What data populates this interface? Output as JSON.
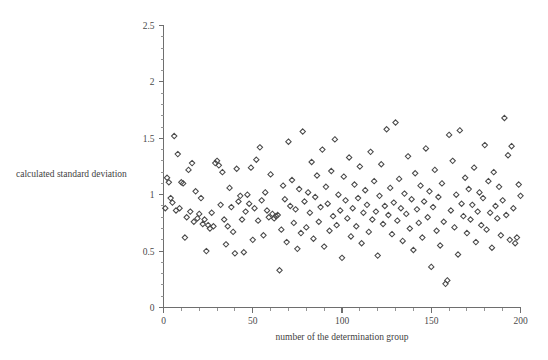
{
  "chart_data": {
    "type": "scatter",
    "title": "",
    "xlabel": "number of the determination group",
    "ylabel": "calculated standard deviation",
    "xlim": [
      0,
      200
    ],
    "ylim": [
      0,
      2.5
    ],
    "grid": false,
    "legend": null,
    "marker": "open-diamond",
    "marker_color": "#4a4a4a",
    "axis_color": "#6e6e6e",
    "background": "#ffffff",
    "x_major_ticks": [
      0,
      50,
      100,
      150,
      200
    ],
    "x_tick_labels": [
      "0",
      "50",
      "100",
      "150",
      "200"
    ],
    "x_minor_step": 10,
    "y_major_ticks": [
      0,
      0.5,
      1,
      1.5,
      2,
      2.5
    ],
    "y_tick_labels": [
      "0",
      "0.5",
      "1",
      "1.5",
      "2",
      "2.5"
    ],
    "y_minor_step": 0.1,
    "n_points": 200,
    "points": [
      [
        1,
        0.88
      ],
      [
        2,
        1.15
      ],
      [
        3,
        1.11
      ],
      [
        4,
        0.97
      ],
      [
        5,
        0.93
      ],
      [
        6,
        1.52
      ],
      [
        7,
        0.86
      ],
      [
        8,
        1.36
      ],
      [
        9,
        0.88
      ],
      [
        10,
        1.11
      ],
      [
        11,
        1.1
      ],
      [
        12,
        0.62
      ],
      [
        13,
        0.8
      ],
      [
        14,
        1.22
      ],
      [
        15,
        0.85
      ],
      [
        16,
        1.28
      ],
      [
        17,
        0.76
      ],
      [
        18,
        1.03
      ],
      [
        19,
        0.79
      ],
      [
        20,
        0.83
      ],
      [
        21,
        0.97
      ],
      [
        22,
        0.74
      ],
      [
        23,
        0.78
      ],
      [
        24,
        0.5
      ],
      [
        25,
        0.73
      ],
      [
        26,
        0.7
      ],
      [
        27,
        0.84
      ],
      [
        28,
        0.72
      ],
      [
        29,
        1.28
      ],
      [
        30,
        1.3
      ],
      [
        31,
        1.26
      ],
      [
        32,
        0.91
      ],
      [
        33,
        1.2
      ],
      [
        34,
        0.78
      ],
      [
        35,
        0.56
      ],
      [
        36,
        0.72
      ],
      [
        37,
        1.06
      ],
      [
        38,
        0.89
      ],
      [
        39,
        0.67
      ],
      [
        40,
        0.48
      ],
      [
        41,
        1.23
      ],
      [
        42,
        0.94
      ],
      [
        43,
        0.99
      ],
      [
        44,
        0.78
      ],
      [
        45,
        0.49
      ],
      [
        46,
        0.85
      ],
      [
        47,
        1.0
      ],
      [
        48,
        0.92
      ],
      [
        49,
        1.24
      ],
      [
        50,
        0.6
      ],
      [
        51,
        0.88
      ],
      [
        52,
        1.31
      ],
      [
        53,
        0.77
      ],
      [
        54,
        1.42
      ],
      [
        55,
        0.95
      ],
      [
        56,
        0.64
      ],
      [
        57,
        1.02
      ],
      [
        58,
        0.86
      ],
      [
        59,
        0.8
      ],
      [
        60,
        1.18
      ],
      [
        61,
        0.83
      ],
      [
        62,
        0.79
      ],
      [
        63,
        0.81
      ],
      [
        64,
        0.82
      ],
      [
        65,
        0.33
      ],
      [
        66,
        0.69
      ],
      [
        67,
        1.08
      ],
      [
        68,
        0.96
      ],
      [
        69,
        0.58
      ],
      [
        70,
        1.47
      ],
      [
        71,
        0.9
      ],
      [
        72,
        1.13
      ],
      [
        73,
        0.75
      ],
      [
        74,
        0.87
      ],
      [
        75,
        0.52
      ],
      [
        76,
        1.05
      ],
      [
        77,
        0.66
      ],
      [
        78,
        1.56
      ],
      [
        79,
        0.94
      ],
      [
        80,
        0.71
      ],
      [
        81,
        1.02
      ],
      [
        82,
        0.84
      ],
      [
        83,
        1.29
      ],
      [
        84,
        0.61
      ],
      [
        85,
        0.98
      ],
      [
        86,
        1.17
      ],
      [
        87,
        0.76
      ],
      [
        88,
        0.89
      ],
      [
        89,
        1.4
      ],
      [
        90,
        0.54
      ],
      [
        91,
        1.07
      ],
      [
        92,
        0.92
      ],
      [
        93,
        0.68
      ],
      [
        94,
        1.21
      ],
      [
        95,
        0.81
      ],
      [
        96,
        1.49
      ],
      [
        97,
        0.73
      ],
      [
        98,
        1.0
      ],
      [
        99,
        0.86
      ],
      [
        100,
        0.44
      ],
      [
        101,
        1.16
      ],
      [
        102,
        0.95
      ],
      [
        103,
        0.79
      ],
      [
        104,
        1.33
      ],
      [
        105,
        0.63
      ],
      [
        106,
        0.88
      ],
      [
        107,
        1.09
      ],
      [
        108,
        0.72
      ],
      [
        109,
        0.97
      ],
      [
        110,
        1.25
      ],
      [
        111,
        0.57
      ],
      [
        112,
        0.84
      ],
      [
        113,
        1.04
      ],
      [
        114,
        0.91
      ],
      [
        115,
        0.67
      ],
      [
        116,
        1.38
      ],
      [
        117,
        0.78
      ],
      [
        118,
        1.12
      ],
      [
        119,
        0.85
      ],
      [
        120,
        0.46
      ],
      [
        121,
        0.99
      ],
      [
        122,
        1.27
      ],
      [
        123,
        0.74
      ],
      [
        124,
        0.9
      ],
      [
        125,
        1.58
      ],
      [
        126,
        0.82
      ],
      [
        127,
        1.06
      ],
      [
        128,
        0.65
      ],
      [
        129,
        0.93
      ],
      [
        130,
        1.64
      ],
      [
        131,
        0.77
      ],
      [
        132,
        1.14
      ],
      [
        133,
        0.88
      ],
      [
        134,
        0.59
      ],
      [
        135,
        1.01
      ],
      [
        136,
        0.83
      ],
      [
        137,
        1.34
      ],
      [
        138,
        0.7
      ],
      [
        139,
        0.96
      ],
      [
        140,
        0.51
      ],
      [
        141,
        1.19
      ],
      [
        142,
        0.87
      ],
      [
        143,
        0.75
      ],
      [
        144,
        1.08
      ],
      [
        145,
        0.62
      ],
      [
        146,
        0.94
      ],
      [
        147,
        1.41
      ],
      [
        148,
        0.8
      ],
      [
        149,
        1.03
      ],
      [
        150,
        0.36
      ],
      [
        151,
        0.89
      ],
      [
        152,
        1.22
      ],
      [
        153,
        0.68
      ],
      [
        154,
        0.98
      ],
      [
        155,
        0.55
      ],
      [
        156,
        1.1
      ],
      [
        157,
        0.76
      ],
      [
        158,
        0.21
      ],
      [
        159,
        0.24
      ],
      [
        160,
        1.53
      ],
      [
        161,
        0.86
      ],
      [
        162,
        1.3
      ],
      [
        163,
        0.71
      ],
      [
        164,
        1.0
      ],
      [
        165,
        0.47
      ],
      [
        166,
        1.57
      ],
      [
        167,
        0.92
      ],
      [
        168,
        0.81
      ],
      [
        169,
        1.15
      ],
      [
        170,
        0.66
      ],
      [
        171,
        1.05
      ],
      [
        172,
        0.78
      ],
      [
        173,
        0.91
      ],
      [
        174,
        1.24
      ],
      [
        175,
        0.58
      ],
      [
        176,
        0.85
      ],
      [
        177,
        1.02
      ],
      [
        178,
        0.73
      ],
      [
        179,
        0.97
      ],
      [
        180,
        1.44
      ],
      [
        181,
        0.69
      ],
      [
        182,
        1.12
      ],
      [
        183,
        0.84
      ],
      [
        184,
        0.53
      ],
      [
        185,
        1.2
      ],
      [
        186,
        0.9
      ],
      [
        187,
        0.79
      ],
      [
        188,
        1.07
      ],
      [
        189,
        0.64
      ],
      [
        190,
        0.95
      ],
      [
        191,
        1.68
      ],
      [
        192,
        0.82
      ],
      [
        193,
        1.35
      ],
      [
        194,
        0.6
      ],
      [
        195,
        1.43
      ],
      [
        196,
        0.88
      ],
      [
        197,
        0.57
      ],
      [
        198,
        0.62
      ],
      [
        199,
        1.09
      ],
      [
        200,
        0.99
      ]
    ]
  }
}
